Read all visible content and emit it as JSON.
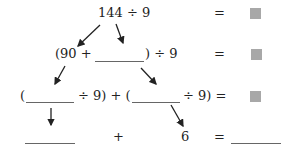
{
  "rows": [
    {
      "expression": "144 ÷ 9",
      "equals": "=",
      "result": "square-placeholder"
    },
    {
      "open": "(90 +",
      "close": ") ÷ 9",
      "equals": "=",
      "result": "square-placeholder"
    },
    {
      "open1": "(",
      "div1": "÷ 9) + (",
      "div2": "÷ 9) =",
      "result": "square-placeholder"
    },
    {
      "plus": "+",
      "value": "6",
      "equals": "="
    }
  ],
  "colors": {
    "square": "#a8a8a8",
    "text": "#222222",
    "lines": "#666666"
  }
}
